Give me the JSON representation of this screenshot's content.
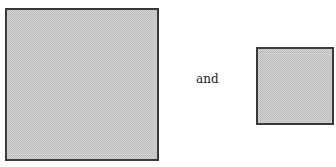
{
  "figure": {
    "shapes": [
      {
        "name": "large-square",
        "fill": "#d4d4d4",
        "border": "#3a3a3a"
      },
      {
        "name": "small-square",
        "fill": "#d4d4d4",
        "border": "#3a3a3a"
      }
    ],
    "connector_text": "and"
  }
}
